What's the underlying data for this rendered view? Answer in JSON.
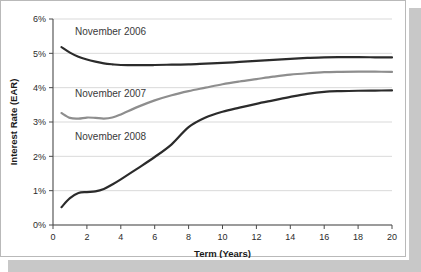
{
  "figure": {
    "background": "#ffffff",
    "card_background": "#ffffff",
    "card_border_color": "#b9b9b9",
    "shadow_color": "#c8c8c8"
  },
  "chart_data": {
    "type": "line",
    "title": "",
    "subtitle": "",
    "xlabel": "Term (Years)",
    "ylabel": "Interest Rate (EAR)",
    "xlim": [
      0,
      20
    ],
    "ylim": [
      0,
      6
    ],
    "grid": true,
    "grid_axis": "y",
    "legend_position": "inline-annotations",
    "xticks": [
      0,
      2,
      4,
      6,
      8,
      10,
      12,
      14,
      16,
      18,
      20
    ],
    "xtick_labels": [
      "0",
      "2",
      "4",
      "6",
      "8",
      "10",
      "12",
      "14",
      "16",
      "18",
      "20"
    ],
    "yticks": [
      0,
      1,
      2,
      3,
      4,
      5,
      6
    ],
    "ytick_labels": [
      "0%",
      "1%",
      "2%",
      "3%",
      "4%",
      "5%",
      "6%"
    ],
    "x": [
      0.5,
      1,
      1.5,
      2,
      2.5,
      3,
      3.5,
      4,
      5,
      6,
      7,
      8,
      9,
      10,
      11,
      12,
      13,
      14,
      15,
      16,
      17,
      18,
      19,
      20
    ],
    "series": [
      {
        "name": "November 2006",
        "label": "November 2006",
        "color": "#2b2b2b",
        "width": 2.2,
        "values": [
          5.18,
          5.02,
          4.9,
          4.82,
          4.76,
          4.71,
          4.68,
          4.66,
          4.655,
          4.66,
          4.67,
          4.68,
          4.7,
          4.72,
          4.75,
          4.78,
          4.81,
          4.84,
          4.865,
          4.885,
          4.89,
          4.89,
          4.885,
          4.88
        ]
      },
      {
        "name": "November 2007",
        "label": "November 2007",
        "color": "#8e8e8e",
        "width": 2.2,
        "values": [
          3.26,
          3.12,
          3.1,
          3.13,
          3.12,
          3.1,
          3.13,
          3.22,
          3.44,
          3.63,
          3.78,
          3.9,
          4.0,
          4.1,
          4.18,
          4.25,
          4.32,
          4.38,
          4.42,
          4.45,
          4.46,
          4.465,
          4.465,
          4.46
        ]
      },
      {
        "name": "November 2008",
        "label": "November 2008",
        "color": "#2b2b2b",
        "width": 2.2,
        "values": [
          0.52,
          0.78,
          0.93,
          0.96,
          0.98,
          1.05,
          1.18,
          1.33,
          1.65,
          1.98,
          2.35,
          2.85,
          3.13,
          3.3,
          3.42,
          3.53,
          3.63,
          3.73,
          3.82,
          3.88,
          3.9,
          3.91,
          3.915,
          3.92
        ]
      }
    ],
    "annotations": [
      {
        "text": "November 2006",
        "x": 1.3,
        "y": 5.52
      },
      {
        "text": "November 2007",
        "x": 1.3,
        "y": 3.72
      },
      {
        "text": "November 2008",
        "x": 1.3,
        "y": 2.47
      }
    ]
  }
}
